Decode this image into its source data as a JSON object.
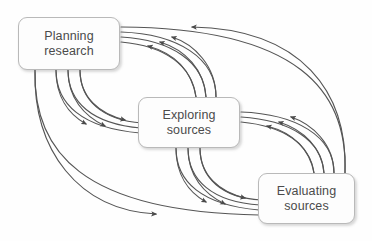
{
  "diagram": {
    "background_color": "#fefefe",
    "box_fill_color": "#fdfdfd",
    "box_border_color": "#b9b9b9",
    "text_color": "#4b4b4b",
    "arrow_color": "#555555",
    "nodes": [
      {
        "id": "planning-research",
        "label": "Planning\nresearch",
        "line1": "Planning",
        "line2": "research",
        "x": 18,
        "y": 17,
        "width": 102,
        "height": 53
      },
      {
        "id": "exploring-sources",
        "label": "Exploring\nsources",
        "line1": "Exploring",
        "line2": "sources",
        "x": 138,
        "y": 97,
        "width": 102,
        "height": 51
      },
      {
        "id": "evaluating-sources",
        "label": "Evaluating\nsources",
        "line1": "Evaluating",
        "line2": "sources",
        "x": 258,
        "y": 173,
        "width": 97,
        "height": 51
      }
    ],
    "edges": [
      {
        "id": "planning-to-exploring-1",
        "from": "planning-research",
        "to": "exploring-sources",
        "direction": "forward"
      },
      {
        "id": "planning-to-exploring-2",
        "from": "planning-research",
        "to": "exploring-sources",
        "direction": "forward"
      },
      {
        "id": "planning-to-exploring-3",
        "from": "planning-research",
        "to": "exploring-sources",
        "direction": "forward"
      },
      {
        "id": "exploring-to-planning-1",
        "from": "exploring-sources",
        "to": "planning-research",
        "direction": "reverse"
      },
      {
        "id": "exploring-to-planning-2",
        "from": "exploring-sources",
        "to": "planning-research",
        "direction": "reverse"
      },
      {
        "id": "exploring-to-planning-3",
        "from": "exploring-sources",
        "to": "planning-research",
        "direction": "reverse"
      },
      {
        "id": "exploring-to-evaluating-1",
        "from": "exploring-sources",
        "to": "evaluating-sources",
        "direction": "forward"
      },
      {
        "id": "exploring-to-evaluating-2",
        "from": "exploring-sources",
        "to": "evaluating-sources",
        "direction": "forward"
      },
      {
        "id": "exploring-to-evaluating-3",
        "from": "exploring-sources",
        "to": "evaluating-sources",
        "direction": "forward"
      },
      {
        "id": "evaluating-to-exploring-1",
        "from": "evaluating-sources",
        "to": "exploring-sources",
        "direction": "reverse"
      },
      {
        "id": "evaluating-to-exploring-2",
        "from": "evaluating-sources",
        "to": "exploring-sources",
        "direction": "reverse"
      },
      {
        "id": "evaluating-to-exploring-3",
        "from": "evaluating-sources",
        "to": "exploring-sources",
        "direction": "reverse"
      },
      {
        "id": "planning-to-evaluating-long",
        "from": "planning-research",
        "to": "evaluating-sources",
        "direction": "forward"
      },
      {
        "id": "evaluating-to-planning-long",
        "from": "evaluating-sources",
        "to": "planning-research",
        "direction": "reverse"
      }
    ]
  }
}
